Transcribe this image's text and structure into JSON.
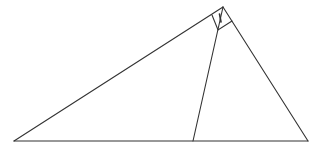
{
  "diagram": {
    "type": "geometry-triangle",
    "stroke_color": "#333333",
    "background": "#ffffff",
    "vertices": {
      "left_base": [
        14,
        141
      ],
      "right_base": [
        308,
        141
      ],
      "apex": [
        223,
        7
      ],
      "cevian_foot": [
        193,
        141
      ]
    },
    "right_angle_marker": {
      "points": [
        [
          223,
          7
        ],
        [
          212,
          15
        ],
        [
          218,
          30
        ],
        [
          232,
          21
        ]
      ]
    },
    "tick_mark": {
      "from": [
        219.5,
        14
      ],
      "to": [
        221,
        22
      ]
    },
    "labels": []
  }
}
